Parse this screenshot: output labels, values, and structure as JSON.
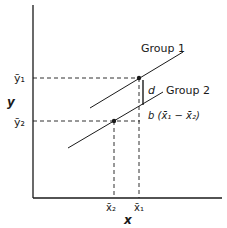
{
  "diagram": {
    "axes": {
      "x_label": "x",
      "y_label": "y"
    },
    "groups": [
      {
        "name": "Group 1",
        "mean_x_label": "x̄₁",
        "mean_y_label": "ȳ₁"
      },
      {
        "name": "Group 2",
        "mean_x_label": "x̄₂",
        "mean_y_label": "ȳ₂"
      }
    ],
    "annotations": {
      "d": "d",
      "slope_term": "b (x̄₁ − x̄₂)"
    },
    "colors": {
      "line": "#1a1a1a",
      "background": "#ffffff"
    }
  }
}
